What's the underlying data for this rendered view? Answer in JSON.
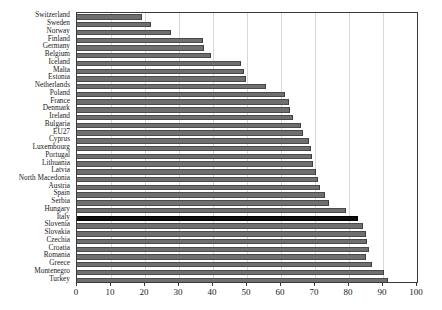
{
  "chart_data": {
    "type": "bar",
    "orientation": "horizontal",
    "title": "",
    "subtitle": "",
    "xlabel": "",
    "ylabel": "",
    "xlim": [
      0,
      100
    ],
    "ylim": null,
    "grid": true,
    "legend": null,
    "xticks": [
      0,
      10,
      20,
      30,
      40,
      50,
      60,
      70,
      80,
      90,
      100
    ],
    "categories": [
      "Switzerland",
      "Sweden",
      "Norway",
      "Finland",
      "Germany",
      "Belgium",
      "Iceland",
      "Malta",
      "Estonia",
      "Netherlands",
      "Poland",
      "France",
      "Denmark",
      "Ireland",
      "Bulgaria",
      "EU27",
      "Cyprus",
      "Luxembourg",
      "Portugal",
      "Lithuania",
      "Latvia",
      "North Macedonia",
      "Austria",
      "Spain",
      "Serbia",
      "Hungary",
      "Italy",
      "Slovenia",
      "Slovakia",
      "Czechia",
      "Croatia",
      "Romania",
      "Greece",
      "Montenegro",
      "Turkey"
    ],
    "values": [
      19.2,
      21.8,
      27.5,
      37.2,
      37.4,
      39.3,
      48.2,
      49.0,
      49.8,
      55.7,
      61.2,
      62.3,
      62.6,
      63.6,
      65.8,
      66.6,
      68.3,
      68.8,
      69.0,
      69.4,
      70.4,
      70.8,
      71.4,
      73.0,
      74.0,
      79.0,
      82.6,
      84.1,
      85.0,
      85.2,
      85.8,
      85.0,
      86.8,
      90.2,
      91.4
    ],
    "highlight_category": "Italy",
    "colors": {
      "bar": "#6f6f6f",
      "bar_edge": "#3c3c3c",
      "highlight_bar": "#0d0d0d",
      "grid": "#d8d8d8",
      "frame": "#3a3a3a",
      "text": "#1a1a1a",
      "background": "#ffffff"
    }
  }
}
